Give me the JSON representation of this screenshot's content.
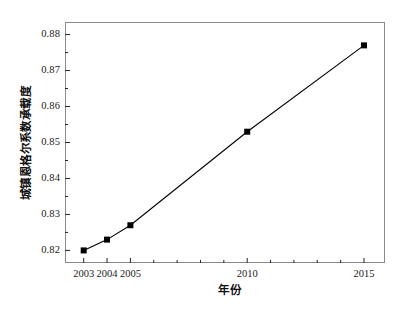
{
  "chart_data": {
    "type": "line",
    "title": "",
    "xlabel": "年份",
    "ylabel": "城镇恩格尔系数承载度",
    "x": [
      2003,
      2004,
      2005,
      2010,
      2015
    ],
    "values": [
      0.82,
      0.823,
      0.827,
      0.853,
      0.877
    ],
    "series": [
      {
        "name": "城镇恩格尔系数承载度",
        "values": [
          0.82,
          0.823,
          0.827,
          0.853,
          0.877
        ]
      }
    ],
    "xtick_labels": [
      "2003",
      "2004",
      "2005",
      "2010",
      "2015"
    ],
    "ytick_labels": [
      "0.82",
      "0.83",
      "0.84",
      "0.85",
      "0.86",
      "0.87",
      "0.88"
    ],
    "ytick_values": [
      0.82,
      0.83,
      0.84,
      0.85,
      0.86,
      0.87,
      0.88
    ],
    "ylim": [
      0.8165,
      0.8835
    ],
    "xlim": [
      2002.2,
      2015.9
    ],
    "minor_y_ticks": [
      0.825,
      0.835,
      0.845,
      0.855,
      0.865,
      0.875
    ],
    "grid": false,
    "legend": "none",
    "marker": "filled-square",
    "marker_color": "#000000",
    "line_color": "#000000",
    "frame_color": "#8a8a8a",
    "background": "#ffffff"
  },
  "axes": {
    "y_tick_labels": [
      {
        "label": "0.88",
        "value": 0.88
      },
      {
        "label": "0.87",
        "value": 0.87
      },
      {
        "label": "0.86",
        "value": 0.86
      },
      {
        "label": "0.85",
        "value": 0.85
      },
      {
        "label": "0.84",
        "value": 0.84
      },
      {
        "label": "0.83",
        "value": 0.83
      },
      {
        "label": "0.82",
        "value": 0.82
      }
    ],
    "x_tick_labels": [
      {
        "label": "2003",
        "value": 2003
      },
      {
        "label": "2004",
        "value": 2004
      },
      {
        "label": "2005",
        "value": 2005
      },
      {
        "label": "2010",
        "value": 2010
      },
      {
        "label": "2015",
        "value": 2015
      }
    ],
    "x_axis_title": "年份",
    "y_axis_title": "城镇恩格尔系数承载度"
  }
}
